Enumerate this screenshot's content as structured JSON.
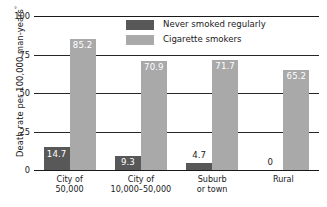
{
  "chart_data": {
    "type": "bar",
    "title": "",
    "xlabel": "",
    "ylabel": "Death rate per 100,000 man-years",
    "ylabel_superscript": "°",
    "ylim": [
      0,
      100
    ],
    "yticks": [
      "100",
      "75",
      "50",
      "25",
      "0"
    ],
    "ytick_values": [
      100,
      75,
      50,
      25,
      0
    ],
    "grid": "horizontal",
    "legend_position": "top-center",
    "categories": [
      "City of\n50,000",
      "City of\n10,000–50,000",
      "Suburb\nor town",
      "Rural"
    ],
    "category_lines": [
      [
        "City of",
        "50,000"
      ],
      [
        "City of",
        "10,000–50,000"
      ],
      [
        "Suburb",
        "or town"
      ],
      [
        "Rural"
      ]
    ],
    "series": [
      {
        "name": "Never smoked regularly",
        "color": "#585858",
        "values": [
          14.7,
          9.3,
          4.7,
          0
        ],
        "labels": [
          "14.7",
          "9.3",
          "4.7",
          "0"
        ],
        "label_placement": [
          "inside",
          "inside",
          "outside",
          "outside"
        ]
      },
      {
        "name": "Cigarette smokers",
        "color": "#a9a9a9",
        "values": [
          85.2,
          70.9,
          71.7,
          65.2
        ],
        "labels": [
          "85.2",
          "70.9",
          "71.7",
          "65.2"
        ],
        "label_placement": [
          "inside",
          "inside",
          "inside",
          "inside"
        ]
      }
    ]
  },
  "legend": {
    "items": [
      {
        "label": "Never smoked regularly",
        "color": "#585858"
      },
      {
        "label": "Cigarette smokers",
        "color": "#a9a9a9"
      }
    ]
  }
}
